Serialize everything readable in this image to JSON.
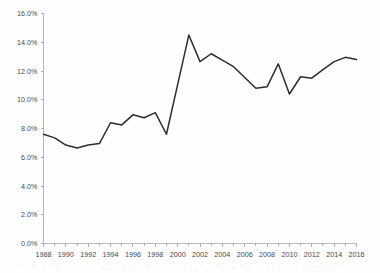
{
  "chart_data": {
    "type": "line",
    "title": "",
    "subtitle": "",
    "xlabel": "",
    "ylabel": "",
    "grid": false,
    "legend": false,
    "legend_position": "none",
    "line_color": "#2d2d2d",
    "background_color": "#fefefe",
    "axis_color": "#b9b9b9",
    "xlim": [
      1988,
      2016
    ],
    "ylim": [
      0,
      16
    ],
    "y_tick_step": 2,
    "x_tick_step": 2,
    "x_minor_tick_step": 1,
    "y_tick_labels": [
      "0.0%",
      "2.0%",
      "4.0%",
      "6.0%",
      "8.0%",
      "10.0%",
      "12.0%",
      "14.0%",
      "16.0%"
    ],
    "y_tick_values": [
      0,
      2,
      4,
      6,
      8,
      10,
      12,
      14,
      16
    ],
    "x_tick_labels": [
      "1988",
      "1990",
      "1992",
      "1994",
      "1996",
      "1998",
      "2000",
      "2002",
      "2004",
      "2006",
      "2008",
      "2010",
      "2012",
      "2014",
      "2016"
    ],
    "x_tick_values": [
      1988,
      1990,
      1992,
      1994,
      1996,
      1998,
      2000,
      2002,
      2004,
      2006,
      2008,
      2010,
      2012,
      2014,
      2016
    ],
    "x": [
      1988,
      1989,
      1990,
      1991,
      1992,
      1993,
      1994,
      1995,
      1996,
      1997,
      1998,
      1999,
      2000,
      2001,
      2002,
      2003,
      2004,
      2005,
      2006,
      2007,
      2008,
      2009,
      2010,
      2011,
      2012,
      2013,
      2014,
      2015,
      2016
    ],
    "values": [
      7.6,
      7.35,
      6.85,
      6.65,
      6.85,
      6.95,
      8.4,
      8.25,
      8.95,
      8.75,
      9.1,
      7.6,
      11.05,
      14.5,
      12.65,
      13.2,
      12.75,
      12.3,
      11.55,
      10.8,
      10.9,
      12.5,
      10.4,
      11.6,
      11.5,
      12.1,
      12.65,
      12.95,
      12.8
    ],
    "series": [
      {
        "name": "",
        "values": [
          7.6,
          7.35,
          6.85,
          6.65,
          6.85,
          6.95,
          8.4,
          8.25,
          8.95,
          8.75,
          9.1,
          7.6,
          11.05,
          14.5,
          12.65,
          13.2,
          12.75,
          12.3,
          11.55,
          10.8,
          10.9,
          12.5,
          10.4,
          11.6,
          11.5,
          12.1,
          12.65,
          12.95,
          12.8
        ]
      }
    ],
    "annotations": []
  }
}
